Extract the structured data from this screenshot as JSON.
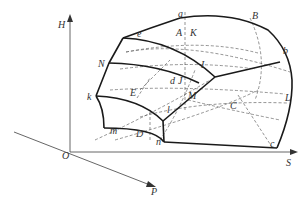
{
  "figure": {
    "type": "3D thermodynamic surface diagram",
    "axes": {
      "vertical": "H",
      "horizontal": "S",
      "depth": "P",
      "origin": "O"
    },
    "point_labels": {
      "a": "a",
      "B": "B",
      "b": "b",
      "e": "e",
      "A": "A",
      "K": "K",
      "N": "N",
      "I": "I",
      "d": "d",
      "J": "J",
      "M": "M",
      "L": "L",
      "C": "C",
      "k": "k",
      "E": "E",
      "m": "m",
      "D": "D",
      "l": "l",
      "n": "n",
      "c": "c"
    }
  }
}
